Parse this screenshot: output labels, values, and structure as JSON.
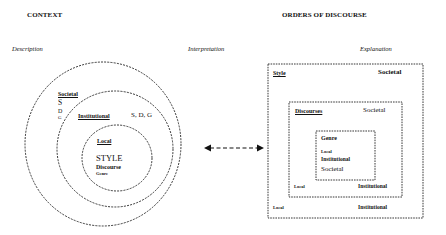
{
  "headings": {
    "context": "CONTEXT",
    "orders_of_discourse": "ORDERS OF DISCOURSE"
  },
  "stages": {
    "description": "Description",
    "interpretation": "Interpretation",
    "explanation": "Explanation"
  },
  "context_diagram": {
    "societal": {
      "label": "Societal",
      "letters": [
        "S",
        "D",
        "G"
      ]
    },
    "institutional": {
      "label": "Institutional",
      "letters": "S, D, G"
    },
    "local": {
      "label": "Local",
      "items": [
        "STYLE",
        "Discourse",
        "Genre"
      ]
    }
  },
  "orders_diagram": {
    "style_box": {
      "label": "Style",
      "top_right": "Societal",
      "bottom_left": "Local",
      "bottom_right": "Institutional"
    },
    "discourses_box": {
      "label": "Discourses",
      "top_right": "Societal",
      "bottom_left": "Local",
      "bottom_right": "Institutional"
    },
    "genre_box": {
      "label": "Genre",
      "items": [
        "Local",
        "Institutional",
        "Societal"
      ]
    }
  },
  "connector": {
    "type": "bidirectional-dashed-arrow"
  }
}
